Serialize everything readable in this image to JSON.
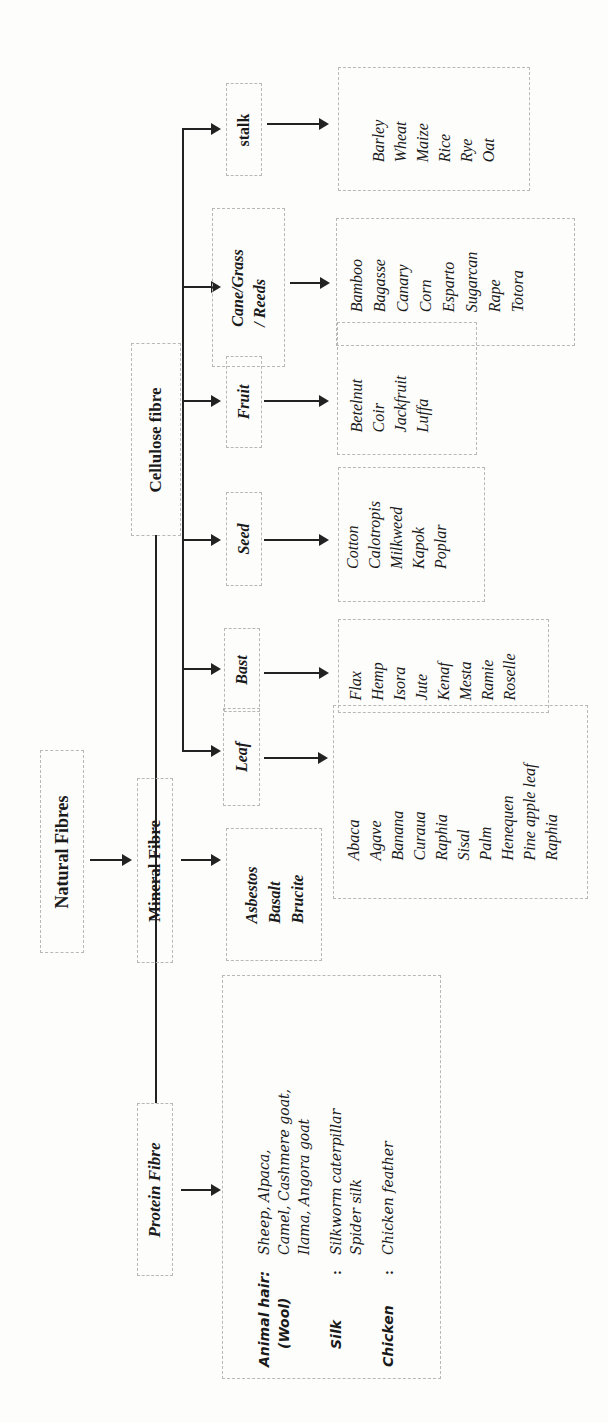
{
  "diagram": {
    "root": {
      "label": "Natural Fibres"
    },
    "branches": {
      "mineral": {
        "label": "Mineral Fibre",
        "items": [
          "Asbestos",
          "Basalt",
          "Brucite"
        ]
      },
      "cellulose": {
        "label": "Cellulose fibre",
        "categories": [
          {
            "label": "Leaf",
            "items": [
              "Abaca",
              "Agave",
              "Banana",
              "Curaua",
              "Raphia",
              "Sisal",
              "Palm",
              "Henequen",
              "Pine apple leaf",
              "Raphia"
            ]
          },
          {
            "label": "Bast",
            "items": [
              "Flax",
              "Hemp",
              "Isora",
              "Jute",
              "Kenaf",
              "Mesta",
              "Ramie",
              "Roselle"
            ]
          },
          {
            "label": "Seed",
            "items": [
              "Cotton",
              "Calotropis",
              "Milkweed",
              "Kapok",
              "Poplar"
            ]
          },
          {
            "label": "Fruit",
            "items": [
              "Betelnut",
              "Coir",
              "Jackfruit",
              "Luffa"
            ]
          },
          {
            "label": "Cane/Grass / Reeds",
            "items": [
              "Bamboo",
              "Bagasse",
              "Canary",
              "Corn",
              "Esparto",
              "Sugarcan",
              "Rape",
              "Totora"
            ]
          },
          {
            "label": "stalk",
            "items": [
              "Barley",
              "Wheat",
              "Maize",
              "Rice",
              "Rye",
              "Oat"
            ]
          }
        ]
      },
      "protein": {
        "label": "Protein Fibre",
        "groups": [
          {
            "label": "Animal hair:",
            "sublabel": "(Wool)",
            "separator": "",
            "lines": [
              "Sheep, Alpaca,",
              "Camel, Cashmere goat,",
              "Ilama, Angora goat"
            ]
          },
          {
            "label": "Silk",
            "sublabel": "",
            "separator": ":",
            "lines": [
              "Silkworm caterpillar",
              "Spider silk"
            ]
          },
          {
            "label": "Chicken",
            "sublabel": "",
            "separator": ":",
            "lines": [
              "Chicken feather"
            ]
          }
        ]
      }
    }
  },
  "cane_label_line1": "Cane/Grass",
  "cane_label_line2": "/ Reeds"
}
